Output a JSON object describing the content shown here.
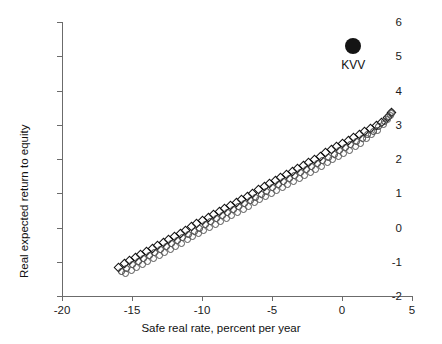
{
  "chart_data": {
    "type": "scatter",
    "title": "",
    "xlabel": "Safe real rate, percent per year",
    "ylabel": "Real expected return to equity",
    "xlim": [
      -20,
      5
    ],
    "ylim": [
      -2,
      6
    ],
    "xticks": [
      -20,
      -15,
      -10,
      -5,
      0,
      5
    ],
    "xticklabels": [
      "-20",
      "-15",
      "-10",
      "-5",
      "0",
      "5"
    ],
    "yticks": [
      -2,
      -1,
      0,
      1,
      2,
      3,
      4,
      5,
      6
    ],
    "yticklabels": [
      "-2",
      "-1",
      "0",
      "1",
      "2",
      "3",
      "4",
      "5",
      "6"
    ],
    "grid": false,
    "legend": "none",
    "annotations": [
      {
        "label": "KVV",
        "x": 0.8,
        "y": 5.3,
        "marker": "filled-circle",
        "color": "#141414"
      }
    ],
    "series": [
      {
        "name": "band-upper",
        "marker": "open-diamond",
        "color": "#111111",
        "points": [
          [
            -16.0,
            -1.15
          ],
          [
            -15.6,
            -1.05
          ],
          [
            -15.2,
            -0.96
          ],
          [
            -14.8,
            -0.87
          ],
          [
            -14.4,
            -0.78
          ],
          [
            -14.0,
            -0.69
          ],
          [
            -13.6,
            -0.6
          ],
          [
            -13.2,
            -0.51
          ],
          [
            -12.8,
            -0.42
          ],
          [
            -12.4,
            -0.33
          ],
          [
            -12.0,
            -0.24
          ],
          [
            -11.6,
            -0.15
          ],
          [
            -11.2,
            -0.06
          ],
          [
            -10.8,
            0.03
          ],
          [
            -10.4,
            0.12
          ],
          [
            -10.0,
            0.21
          ],
          [
            -9.6,
            0.3
          ],
          [
            -9.2,
            0.39
          ],
          [
            -8.8,
            0.48
          ],
          [
            -8.4,
            0.57
          ],
          [
            -8.0,
            0.66
          ],
          [
            -7.6,
            0.75
          ],
          [
            -7.2,
            0.84
          ],
          [
            -6.8,
            0.93
          ],
          [
            -6.4,
            1.02
          ],
          [
            -6.0,
            1.11
          ],
          [
            -5.6,
            1.2
          ],
          [
            -5.2,
            1.29
          ],
          [
            -4.8,
            1.38
          ],
          [
            -4.4,
            1.47
          ],
          [
            -4.0,
            1.56
          ],
          [
            -3.6,
            1.65
          ],
          [
            -3.2,
            1.74
          ],
          [
            -2.8,
            1.83
          ],
          [
            -2.4,
            1.92
          ],
          [
            -2.0,
            2.01
          ],
          [
            -1.6,
            2.1
          ],
          [
            -1.2,
            2.19
          ],
          [
            -0.8,
            2.28
          ],
          [
            -0.4,
            2.37
          ],
          [
            0.0,
            2.46
          ],
          [
            0.4,
            2.55
          ],
          [
            0.8,
            2.64
          ],
          [
            1.2,
            2.73
          ],
          [
            1.6,
            2.82
          ],
          [
            2.0,
            2.91
          ],
          [
            2.4,
            3.0
          ],
          [
            2.8,
            3.09
          ],
          [
            3.2,
            3.23
          ],
          [
            3.5,
            3.38
          ]
        ]
      },
      {
        "name": "band-middle",
        "marker": "open-circle",
        "color": "#333333",
        "points": [
          [
            -15.8,
            -1.26
          ],
          [
            -15.4,
            -1.17
          ],
          [
            -15.0,
            -1.08
          ],
          [
            -14.6,
            -0.99
          ],
          [
            -14.2,
            -0.9
          ],
          [
            -13.8,
            -0.81
          ],
          [
            -13.4,
            -0.72
          ],
          [
            -13.0,
            -0.63
          ],
          [
            -12.6,
            -0.54
          ],
          [
            -12.2,
            -0.45
          ],
          [
            -11.8,
            -0.36
          ],
          [
            -11.4,
            -0.27
          ],
          [
            -11.0,
            -0.18
          ],
          [
            -10.6,
            -0.09
          ],
          [
            -10.2,
            0.0
          ],
          [
            -9.8,
            0.09
          ],
          [
            -9.4,
            0.18
          ],
          [
            -9.0,
            0.27
          ],
          [
            -8.6,
            0.36
          ],
          [
            -8.2,
            0.45
          ],
          [
            -7.8,
            0.54
          ],
          [
            -7.4,
            0.63
          ],
          [
            -7.0,
            0.72
          ],
          [
            -6.6,
            0.81
          ],
          [
            -6.2,
            0.9
          ],
          [
            -5.8,
            0.99
          ],
          [
            -5.4,
            1.08
          ],
          [
            -5.0,
            1.17
          ],
          [
            -4.6,
            1.26
          ],
          [
            -4.2,
            1.35
          ],
          [
            -3.8,
            1.44
          ],
          [
            -3.4,
            1.53
          ],
          [
            -3.0,
            1.62
          ],
          [
            -2.6,
            1.71
          ],
          [
            -2.2,
            1.8
          ],
          [
            -1.8,
            1.89
          ],
          [
            -1.4,
            1.98
          ],
          [
            -1.0,
            2.07
          ],
          [
            -0.6,
            2.16
          ],
          [
            -0.2,
            2.25
          ],
          [
            0.2,
            2.34
          ],
          [
            0.6,
            2.43
          ],
          [
            1.0,
            2.52
          ],
          [
            1.4,
            2.62
          ],
          [
            1.8,
            2.72
          ],
          [
            2.2,
            2.83
          ],
          [
            2.6,
            2.95
          ],
          [
            3.0,
            3.1
          ],
          [
            3.3,
            3.25
          ],
          [
            3.5,
            3.36
          ]
        ]
      },
      {
        "name": "band-lower",
        "marker": "open-circle",
        "color": "#555555",
        "points": [
          [
            -15.5,
            -1.34
          ],
          [
            -15.1,
            -1.25
          ],
          [
            -14.7,
            -1.16
          ],
          [
            -14.3,
            -1.07
          ],
          [
            -13.9,
            -0.98
          ],
          [
            -13.5,
            -0.89
          ],
          [
            -13.1,
            -0.8
          ],
          [
            -12.7,
            -0.71
          ],
          [
            -12.3,
            -0.62
          ],
          [
            -11.9,
            -0.53
          ],
          [
            -11.5,
            -0.44
          ],
          [
            -11.1,
            -0.35
          ],
          [
            -10.7,
            -0.26
          ],
          [
            -10.3,
            -0.17
          ],
          [
            -9.9,
            -0.08
          ],
          [
            -9.5,
            0.01
          ],
          [
            -9.1,
            0.1
          ],
          [
            -8.7,
            0.19
          ],
          [
            -8.3,
            0.28
          ],
          [
            -7.9,
            0.37
          ],
          [
            -7.5,
            0.46
          ],
          [
            -7.1,
            0.55
          ],
          [
            -6.7,
            0.64
          ],
          [
            -6.3,
            0.73
          ],
          [
            -5.9,
            0.82
          ],
          [
            -5.5,
            0.91
          ],
          [
            -5.1,
            1.0
          ],
          [
            -4.7,
            1.09
          ],
          [
            -4.3,
            1.18
          ],
          [
            -3.9,
            1.27
          ],
          [
            -3.5,
            1.36
          ],
          [
            -3.1,
            1.45
          ],
          [
            -2.7,
            1.54
          ],
          [
            -2.3,
            1.63
          ],
          [
            -1.9,
            1.72
          ],
          [
            -1.5,
            1.81
          ],
          [
            -1.1,
            1.9
          ],
          [
            -0.7,
            1.99
          ],
          [
            -0.3,
            2.08
          ],
          [
            0.1,
            2.17
          ],
          [
            0.5,
            2.27
          ],
          [
            0.9,
            2.37
          ],
          [
            1.3,
            2.48
          ],
          [
            1.7,
            2.6
          ],
          [
            2.1,
            2.72
          ],
          [
            2.5,
            2.86
          ],
          [
            2.9,
            3.01
          ],
          [
            3.2,
            3.16
          ],
          [
            3.4,
            3.28
          ],
          [
            3.5,
            3.34
          ]
        ]
      }
    ]
  }
}
